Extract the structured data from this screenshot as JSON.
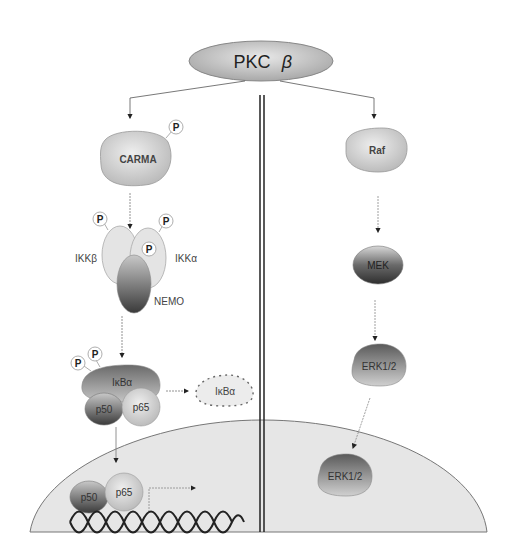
{
  "diagram": {
    "type": "signaling-pathway",
    "top_node": {
      "label": "PKC",
      "greek": "β"
    },
    "left_pathway": {
      "carma": {
        "label": "CARMA",
        "phospho": "P"
      },
      "ikk_complex": {
        "ikk_beta": {
          "label": "IKKβ",
          "phospho": "P"
        },
        "ikk_alpha": {
          "label": "IKKα",
          "phospho": [
            "P",
            "P"
          ]
        },
        "nemo": {
          "label": "NEMO"
        }
      },
      "ikb_complex": {
        "ikba": {
          "label": "IκBα",
          "phospho": [
            "P",
            "P"
          ]
        },
        "p50": {
          "label": "p50"
        },
        "p65": {
          "label": "p65"
        }
      },
      "degraded_ikba": {
        "label": "IκBα"
      },
      "nuclear": {
        "p50": {
          "label": "p50"
        },
        "p65": {
          "label": "p65"
        }
      }
    },
    "right_pathway": {
      "raf": {
        "label": "Raf"
      },
      "mek": {
        "label": "MEK"
      },
      "erk_cyto": {
        "label": "ERK1/2"
      },
      "erk_nuclear": {
        "label": "ERK1/2"
      }
    },
    "colors": {
      "light_node": "#d4d4d4",
      "dark_node": "#4a4a4a",
      "nucleus_fill": "#e6e6e6",
      "line": "#333333",
      "divider": "#222222"
    }
  }
}
